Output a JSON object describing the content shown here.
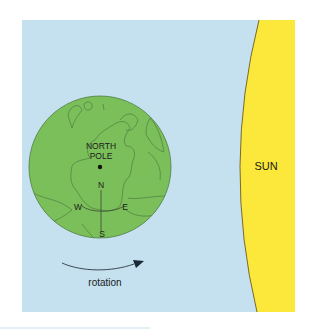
{
  "diagram": {
    "labels": {
      "north_pole_line1": "NORTH",
      "north_pole_line2": "POLE",
      "north": "N",
      "south": "S",
      "east": "E",
      "west": "W",
      "sun": "SUN",
      "rotation": "rotation"
    },
    "colors": {
      "space": "#c5e0ee",
      "earth": "#7bbf5a",
      "earth_outline": "#4f7d44",
      "sun": "#fbe83a",
      "text": "#1a1a1a",
      "background": "#ffffff"
    }
  }
}
